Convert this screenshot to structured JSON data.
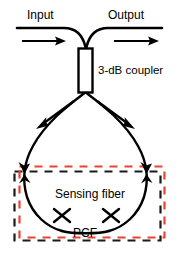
{
  "figure": {
    "kind": "optical-fiber-sagnac-loop-diagram",
    "labels": {
      "input": "Input",
      "output": "Output",
      "coupler": "3-dB coupler",
      "sensing_fiber": "Sensing fiber",
      "pcf": "PCF"
    },
    "colors": {
      "fiber_line": "#000000",
      "text": "#000000",
      "background": "#ffffff",
      "black_dashed_box": "#1a1a1a",
      "red_dashed_box": "#e8442f",
      "coupler_fill": "#ffffff",
      "coupler_stroke": "#000000"
    },
    "elements": {
      "input_line": "horizontal-fiber-left",
      "output_line": "horizontal-fiber-right",
      "input_arrow": "arrow-right",
      "output_arrow": "arrow-right",
      "coupler_body": "3-db-coupler-rectangle",
      "loop": "fiber-loop-teardrop",
      "loop_arrow_left_down": "arrow-down-left",
      "loop_arrow_right_down": "arrow-down-right",
      "loop_arrow_left_junction": "double-arrowhead-left",
      "loop_arrow_right_junction": "double-arrowhead-right",
      "splice_left": "splice-x-mark",
      "splice_right": "splice-x-mark",
      "black_box": "pcf-region-dashed-rectangle",
      "red_box": "sensing-region-dashed-rectangle"
    }
  }
}
